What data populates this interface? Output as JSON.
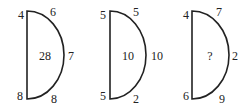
{
  "puzzle": {
    "stroke_color": "#222222",
    "shapes": [
      {
        "top_left": "4",
        "top_right": "6",
        "right": "7",
        "bottom_left": "8",
        "bottom_right": "8",
        "center": "28"
      },
      {
        "top_left": "5",
        "top_right": "5",
        "right": "10",
        "bottom_left": "5",
        "bottom_right": "2",
        "center": "10"
      },
      {
        "top_left": "4",
        "top_right": "7",
        "right": "2",
        "bottom_left": "6",
        "bottom_right": "9",
        "center": "?"
      }
    ]
  }
}
